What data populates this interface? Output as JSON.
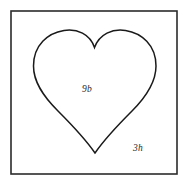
{
  "figure": {
    "canvas": {
      "width": 189,
      "height": 185,
      "background": "#ffffff"
    },
    "frame": {
      "name": "outer-square-border",
      "x": 11,
      "y": 11,
      "width": 166,
      "height": 163,
      "stroke": "#2b2b2b",
      "stroke_width": 1.6,
      "fill": "none"
    },
    "shape": {
      "name": "heart-outline",
      "type": "heart",
      "stroke": "#1a1a1a",
      "stroke_width": 1.5,
      "fill": "none",
      "bounds": {
        "left": 33,
        "right": 156,
        "top": 30,
        "bottom": 153
      },
      "apex_notch": {
        "x": 94,
        "y": 47
      },
      "bottom_tip": {
        "x": 95,
        "y": 153
      },
      "path": "M 94.5 47.5 C 90 34 77 28.5 64 30.5 C 48 33 33.5 45 33.5 66 C 33.5 82 43 96 58 111 C 72 125 86 140 95 153 C 104 140 118 125 132 111 C 147 96 156 82 156 66 C 156 45 141.5 33 125.5 30.5 C 112.5 28.5 99.5 34 94.5 47.5 Z"
    },
    "labels": [
      {
        "name": "label-inside-heart",
        "text": "9b",
        "x": 82,
        "y": 92,
        "color": "#2b2b2b",
        "style": "italic"
      },
      {
        "name": "label-lower-right",
        "text": "3h",
        "x": 133,
        "y": 151,
        "color": "#2b2b2b",
        "style": "italic"
      }
    ]
  }
}
